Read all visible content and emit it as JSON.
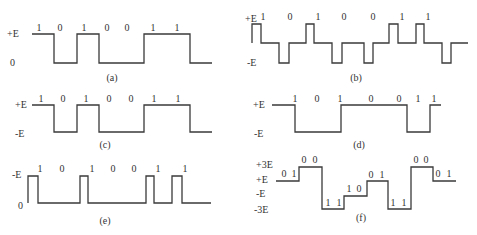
{
  "figure": {
    "stroke_color": "#3a3a3a",
    "panels": [
      {
        "id": "a",
        "caption": "(a)",
        "levels": [
          "+E",
          "0"
        ],
        "bits": [
          "1",
          "0",
          "1",
          "0",
          "0",
          "1",
          "1"
        ],
        "bit_x": [
          39,
          60,
          84,
          107,
          127,
          153,
          177
        ],
        "bit_y": 31,
        "level_pos": [
          [
            7,
            37
          ],
          [
            10,
            66
          ]
        ],
        "caption_pos": [
          112,
          81
        ],
        "path": "M32,34 H54 V63 H77 V34 H99 V63 H144 V34 H190 V63 H212"
      },
      {
        "id": "b",
        "caption": "(b)",
        "levels": [
          "+E",
          "-E"
        ],
        "bits": [
          "1",
          "0",
          "1",
          "0",
          "0",
          "1",
          "1"
        ],
        "bit_x": [
          263,
          290,
          318,
          344,
          373,
          402,
          428
        ],
        "bit_y": 20,
        "level_pos": [
          [
            245,
            22
          ],
          [
            247,
            66
          ]
        ],
        "caption_pos": [
          356,
          81
        ],
        "path": "M252,43 V24 H261 V43 H279 V63 H289 V43 H306 V24 H314 V43 H332 V63 H342 V43 H364 V63 H373 V43 H389 V24 H398 V43 H416 V24 H424 V43 H442 V63 H451 V43 H468"
      },
      {
        "id": "c",
        "caption": "(c)",
        "levels": [
          "+E",
          "-E"
        ],
        "bits": [
          "1",
          "0",
          "1",
          "0",
          "0",
          "1",
          "1"
        ],
        "bit_x": [
          41,
          63,
          86,
          109,
          131,
          154,
          178
        ],
        "bit_y": 102,
        "level_pos": [
          [
            15,
            108
          ],
          [
            15,
            137
          ]
        ],
        "caption_pos": [
          105,
          148
        ],
        "path": "M32,105 H54 V132 H77 V105 H99 V132 H144 V105 H190 V132 H212"
      },
      {
        "id": "d",
        "caption": "(d)",
        "levels": [
          "+E",
          "-E"
        ],
        "bits": [
          "1",
          "0",
          "1",
          "0",
          "0",
          "1",
          "1"
        ],
        "bit_x": [
          295,
          317,
          340,
          371,
          399,
          418,
          434
        ],
        "bit_y": 102,
        "level_pos": [
          [
            253,
            108
          ],
          [
            254,
            137
          ]
        ],
        "caption_pos": [
          359,
          148
        ],
        "path": "M272,105 H295 V132 H341 V105 H407 V132 H430 V105 H441"
      },
      {
        "id": "e",
        "caption": "(e)",
        "levels": [
          "-E",
          "0"
        ],
        "bits": [
          "1",
          "0",
          "1",
          "0",
          "0",
          "1",
          "1"
        ],
        "bit_x": [
          40,
          62,
          92,
          113,
          134,
          158,
          185
        ],
        "bit_y": 172,
        "level_pos": [
          [
            12,
            178
          ],
          [
            18,
            209
          ]
        ],
        "caption_pos": [
          105,
          224
        ],
        "path": "M28,203 V176 H38 V203 H80 V176 H88 V203 H146 V176 H154 V203 H172 V176 H182 V203 H211"
      },
      {
        "id": "f",
        "caption": "(f)",
        "levels": [
          "+3E",
          "+E",
          "-E",
          "-3E"
        ],
        "bits": [
          "0",
          "1",
          "0",
          "0",
          "1",
          "1",
          "1",
          "0",
          "0",
          "1",
          "1",
          "1",
          "0",
          "0",
          "0",
          "1"
        ],
        "bit_x": [
          284,
          294,
          304,
          315,
          328,
          339,
          349,
          359,
          371,
          382,
          393,
          404,
          416,
          426,
          438,
          449
        ],
        "bit_y_per_bit": [
          177,
          177,
          163,
          163,
          206,
          206,
          192,
          192,
          178,
          178,
          206,
          206,
          163,
          163,
          177,
          177
        ],
        "level_pos": [
          [
            256,
            168
          ],
          [
            256,
            183
          ],
          [
            256,
            197
          ],
          [
            254,
            213
          ]
        ],
        "caption_pos": [
          361,
          221
        ],
        "path": "M276,181 H299 V167 H322 V209 H344 V196 H367 V181 H388 V209 H411 V167 H433 V181 H456"
      }
    ]
  }
}
